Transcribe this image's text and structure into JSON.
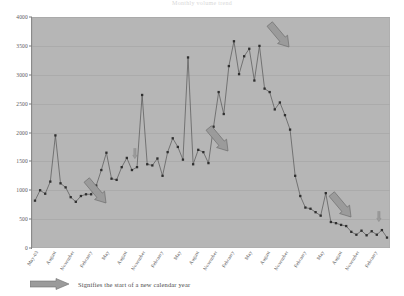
{
  "chart_data": {
    "type": "line",
    "title": "Monthly volume trend",
    "xlabel": "",
    "ylabel": "",
    "ylim": [
      0,
      4000
    ],
    "ytick_step": 500,
    "yticks": [
      0,
      500,
      1000,
      1500,
      2000,
      2500,
      3000,
      3500,
      4000
    ],
    "grid": true,
    "legend_position": "below-plot",
    "marker": "square",
    "line_color": "#555555",
    "marker_color": "#2f2f2f",
    "plot_background": "#b6b6b6",
    "x": [
      "May-03",
      "June",
      "July",
      "August",
      "September",
      "October",
      "November",
      "December",
      "January",
      "February",
      "March",
      "April",
      "May",
      "June",
      "July",
      "August",
      "September",
      "October",
      "November",
      "December",
      "January",
      "February",
      "March",
      "April",
      "May",
      "June",
      "July",
      "August",
      "September",
      "October",
      "November",
      "December",
      "January",
      "February",
      "March",
      "April",
      "May",
      "June",
      "July",
      "August",
      "September",
      "October",
      "November",
      "December",
      "January",
      "February",
      "March",
      "April",
      "May",
      "June",
      "July",
      "August",
      "September",
      "October",
      "November",
      "December",
      "January",
      "February",
      "March",
      "April",
      "May",
      "June",
      "July",
      "August",
      "September",
      "October",
      "November",
      "December",
      "January",
      "February"
    ],
    "xtick_labels": [
      "May-03",
      "August",
      "November",
      "February",
      "May",
      "August",
      "November",
      "February",
      "May",
      "August",
      "November",
      "February",
      "May",
      "August",
      "November",
      "February",
      "May",
      "August",
      "November",
      "February"
    ],
    "values": [
      820,
      1000,
      940,
      1150,
      1950,
      1120,
      1050,
      880,
      800,
      900,
      930,
      930,
      1080,
      1350,
      1650,
      1200,
      1180,
      1400,
      1560,
      1350,
      1400,
      2650,
      1450,
      1430,
      1550,
      1250,
      1660,
      1900,
      1750,
      1530,
      3300,
      1450,
      1700,
      1660,
      1470,
      2100,
      2700,
      2320,
      3150,
      3580,
      3010,
      3320,
      3450,
      2900,
      3500,
      2760,
      2700,
      2400,
      2520,
      2300,
      2050,
      1250,
      900,
      700,
      680,
      620,
      560,
      950,
      450,
      430,
      400,
      380,
      280,
      230,
      300,
      220,
      290,
      230,
      310,
      180
    ],
    "annotations": [
      {
        "label": "new-calendar-year",
        "x_index": 8,
        "y_value": 800
      },
      {
        "label": "new-calendar-year",
        "x_index": 20,
        "y_value": 1400
      },
      {
        "label": "new-calendar-year",
        "x_index": 32,
        "y_value": 1700
      },
      {
        "label": "new-calendar-year",
        "x_index": 44,
        "y_value": 3500
      },
      {
        "label": "new-calendar-year",
        "x_index": 56,
        "y_value": 560
      },
      {
        "label": "new-calendar-year",
        "x_index": 68,
        "y_value": 310
      }
    ]
  },
  "legend": {
    "text": "Signifies the start of a new calendar year",
    "arrow_icon": "right-block-arrow-icon",
    "arrow_color": "#9a9a9a"
  }
}
